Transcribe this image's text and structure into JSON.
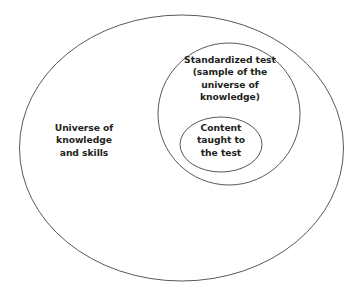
{
  "diagram": {
    "background_color": "#ffffff",
    "stroke_color": "#58585a",
    "text_color": "#231f20",
    "shapes": {
      "outer": {
        "name": "universe-of-knowledge-ellipse",
        "label": "Universe of\nknowledge\nand skills",
        "cx": 181.5,
        "cy": 148,
        "rx": 162,
        "ry": 133
      },
      "middle": {
        "name": "standardized-test-ellipse",
        "label": "Standardized test\n(sample of the\nuniverse of\nknowledge)",
        "cx": 229,
        "cy": 114,
        "rx": 71,
        "ry": 71
      },
      "inner": {
        "name": "content-taught-ellipse",
        "label": "Content\ntaught to\nthe test",
        "cx": 221,
        "cy": 144.5,
        "rx": 41,
        "ry": 27.5
      }
    }
  }
}
